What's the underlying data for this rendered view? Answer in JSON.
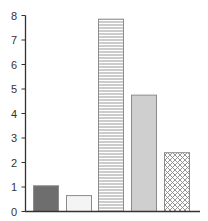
{
  "chart_data": {
    "type": "bar",
    "title": "",
    "xlabel": "",
    "ylabel": "",
    "categories": [
      "1",
      "2",
      "3",
      "4",
      "5"
    ],
    "values": [
      1.05,
      0.65,
      7.85,
      4.75,
      2.4
    ],
    "ylim": [
      0,
      8
    ],
    "yticks": [
      0,
      1,
      2,
      3,
      4,
      5,
      6,
      7,
      8
    ],
    "grid": false,
    "legend": null,
    "bar_styles": [
      {
        "fill": "#6e6e6e",
        "pattern": "solid"
      },
      {
        "fill": "#f4f4f4",
        "pattern": "solid"
      },
      {
        "fill": "#ffffff",
        "pattern": "horizontal-lines"
      },
      {
        "fill": "#cfcfcf",
        "pattern": "solid"
      },
      {
        "fill": "#ffffff",
        "pattern": "crosshatch"
      }
    ]
  },
  "axis": {
    "color": "#333333",
    "tick_labels": [
      "0",
      "1",
      "2",
      "3",
      "4",
      "5",
      "6",
      "7",
      "8"
    ]
  }
}
